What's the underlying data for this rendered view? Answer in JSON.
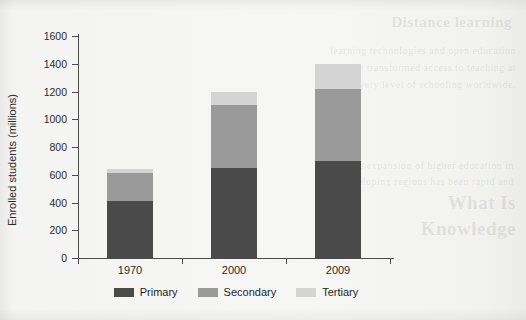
{
  "chart_data": {
    "type": "bar",
    "stacked": true,
    "title": "",
    "xlabel": "",
    "ylabel": "Enrolled students (millions)",
    "categories": [
      "1970",
      "2000",
      "2009"
    ],
    "series": [
      {
        "name": "Primary",
        "color": "#4a4a4a",
        "values": [
          410,
          650,
          700
        ]
      },
      {
        "name": "Secondary",
        "color": "#9a9a9a",
        "values": [
          200,
          450,
          520
        ]
      },
      {
        "name": "Tertiary",
        "color": "#d4d4d4",
        "values": [
          30,
          100,
          180
        ]
      }
    ],
    "totals": [
      640,
      1200,
      1400
    ],
    "ylim": [
      0,
      1600
    ],
    "ytick_step": 200,
    "yticks": [
      "0",
      "200",
      "400",
      "600",
      "800",
      "1000",
      "1200",
      "1400",
      "1600"
    ],
    "grid": false,
    "legend_position": "bottom"
  },
  "legend": {
    "items": [
      {
        "label": "Primary"
      },
      {
        "label": "Secondary"
      },
      {
        "label": "Tertiary"
      }
    ]
  },
  "page_bleed": {
    "line1": "Distance learning",
    "line2": "learning technologies and open education",
    "line3": "have transformed access to teaching at",
    "line4": "every level of schooling worldwide.",
    "line5": "the expansion of higher education in",
    "line6": "developing regions has been rapid and",
    "line7": "What Is",
    "line8": "Knowledge"
  }
}
